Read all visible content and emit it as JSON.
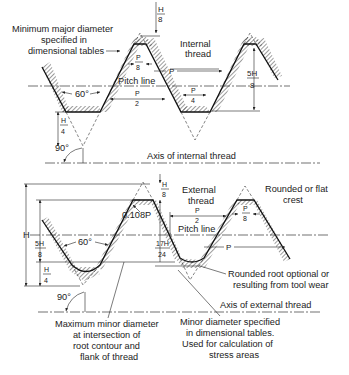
{
  "diagram": {
    "type": "Unified/ISO screw thread basic profile",
    "internal_thread": {
      "title": "Internal\nthread",
      "title_line1": "Internal",
      "title_line2": "thread",
      "labels": {
        "min_major_line1": "Minimum major diameter",
        "min_major_line2": "specified in",
        "min_major_line3": "dimensional tables",
        "pitch_line": "Pitch line",
        "angle": "60°",
        "right_angle": "90°",
        "axis": "Axis of internal thread"
      },
      "dims": {
        "h8_num": "H",
        "h8_den": "8",
        "p8_num": "P",
        "p8_den": "8",
        "p": "P",
        "p2_num": "P",
        "p2_den": "2",
        "p4_num": "P",
        "p4_den": "4",
        "h4_num": "H",
        "h4_den": "4",
        "five_h8_num": "5H",
        "five_h8_den": "8"
      }
    },
    "external_thread": {
      "title_line1": "External",
      "title_line2": "thread",
      "labels": {
        "crest_line1": "Rounded or flat",
        "crest_line2": "crest",
        "pitch_line": "Pitch line",
        "angle": "60°",
        "right_angle": "90°",
        "root_rounding": "0.108P",
        "rounded_root_line1": "Rounded root optional or",
        "rounded_root_line2": "resulting from tool wear",
        "axis": "Axis of external thread",
        "max_minor_line1": "Maximum minor diameter",
        "max_minor_line2": "at intersection of",
        "max_minor_line3": "root contour and",
        "max_minor_line4": "flank of thread",
        "minor_spec_line1": "Minor diameter specified",
        "minor_spec_line2": "in dimensional tables.",
        "minor_spec_line3": "Used for calculation of",
        "minor_spec_line4": "stress areas"
      },
      "dims": {
        "H": "H",
        "h8_num": "H",
        "h8_den": "8",
        "p8_num": "P",
        "p8_den": "8",
        "p": "P",
        "p2_num": "P",
        "p2_den": "2",
        "five_h8_num": "5H",
        "five_h8_den": "8",
        "h4_num": "H",
        "h4_den": "4",
        "seventeen_h24_num": "17H",
        "seventeen_h24_den": "24"
      }
    }
  }
}
